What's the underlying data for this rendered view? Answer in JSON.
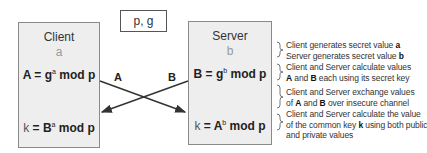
{
  "params_box": {
    "label": "p, g"
  },
  "client": {
    "title": "Client",
    "secret": "a",
    "public_formula": {
      "lhs": "A = g",
      "exp": "a",
      "rhs": " mod p"
    },
    "key_formula": {
      "lhs": "k",
      "mid": " = B",
      "exp": "a",
      "rhs": " mod p"
    }
  },
  "server": {
    "title": "Server",
    "secret": "b",
    "public_formula": {
      "lhs": "B = g",
      "exp": "b",
      "rhs": " mod p"
    },
    "key_formula": {
      "lhs": "k",
      "mid": " = A",
      "exp": "b",
      "rhs": " mod p"
    }
  },
  "exchange": {
    "label_a": "A",
    "label_b": "B"
  },
  "notes": [
    {
      "line1_pre": "Client generates secret value ",
      "line1_bold": "a",
      "line2_pre": "Server generates secret value ",
      "line2_bold": "b"
    },
    {
      "line1": "Client and Server calculate values",
      "line2_bold_a": "A",
      "line2_mid": " and ",
      "line2_bold_b": "B",
      "line2_post": " each using its secret key"
    },
    {
      "line1": "Client and Server exchange values",
      "line2_pre": "of ",
      "line2_bold_a": "A",
      "line2_mid": " and ",
      "line2_bold_b": "B",
      "line2_post": " over insecure channel"
    },
    {
      "line1": "Client and Server calculate the value",
      "line2_pre": "of the common key ",
      "line2_bold": "k",
      "line2_post": " using both public",
      "line3": "and private values"
    }
  ]
}
